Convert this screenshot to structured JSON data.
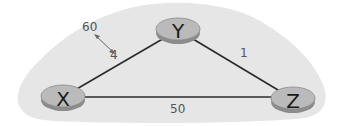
{
  "diagram": {
    "type": "network-topology",
    "background": {
      "color": "#e6e6e6",
      "shape": "cloud"
    },
    "routers": [
      {
        "id": "X",
        "label": "X",
        "cx": 63,
        "cy": 97
      },
      {
        "id": "Y",
        "label": "Y",
        "cx": 178,
        "cy": 30
      },
      {
        "id": "Z",
        "label": "Z",
        "cx": 293,
        "cy": 99
      }
    ],
    "links": [
      {
        "from": "X",
        "to": "Y",
        "cost": "4"
      },
      {
        "from": "Y",
        "to": "Z",
        "cost": "1"
      },
      {
        "from": "X",
        "to": "Z",
        "cost": "50"
      }
    ],
    "cost_change": {
      "link": "X-Y",
      "old_cost": "4",
      "new_cost": "60"
    },
    "colors": {
      "router_fill": "#b9b9b9",
      "router_edge": "#8c8c8c",
      "link": "#2b2b2b",
      "label": "#555555",
      "arrow": "#555555"
    }
  }
}
